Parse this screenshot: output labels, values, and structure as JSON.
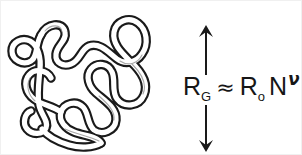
{
  "figure": {
    "name": "polymer-coil-radius-of-gyration-figure",
    "background_color": "#ffffff",
    "ink_color": "#161616"
  },
  "illustration": {
    "name": "polymer-random-coil-drawing",
    "description": "random-coil-polymer-chain",
    "stroke_color": "#1a1a1a",
    "fill_color": "#ffffff"
  },
  "annotation": {
    "arrow_up": "↑",
    "arrow_down": "↓",
    "arrow_label": "radius-of-gyration-extent"
  },
  "formula": {
    "full_text": "R_G ≈ R_o N^ν",
    "lhs": {
      "base": "R",
      "subscript": "G"
    },
    "operator": "≈",
    "rhs": {
      "prefactor_base": "R",
      "prefactor_subscript": "o",
      "variable": "N",
      "exponent": "ν"
    }
  }
}
